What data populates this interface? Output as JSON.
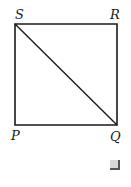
{
  "diagram": {
    "type": "square with diagonal",
    "vertices": {
      "S": {
        "label": "S",
        "x": 15,
        "y": 24
      },
      "R": {
        "label": "R",
        "x": 117,
        "y": 24
      },
      "P": {
        "label": "P",
        "x": 15,
        "y": 125
      },
      "Q": {
        "label": "Q",
        "x": 117,
        "y": 125
      }
    },
    "edges": [
      "SR",
      "RQ",
      "QP",
      "PS",
      "SQ"
    ],
    "stroke_color": "#1a1a1a"
  },
  "checkbox": {
    "checked": false,
    "color": "#d8d8d8"
  }
}
